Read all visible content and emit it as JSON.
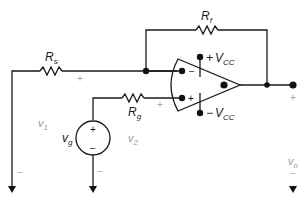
{
  "diagram": {
    "type": "op-amp circuit",
    "components": {
      "Rs": {
        "label": "R",
        "sub": "s"
      },
      "Rf": {
        "label": "R",
        "sub": "f"
      },
      "Rg": {
        "label": "R",
        "sub": "g"
      },
      "vg": {
        "label": "v",
        "sub": "g",
        "plus": "+",
        "minus": "−"
      },
      "opamp": {
        "inv": "−",
        "noninv": "+",
        "vcc_pos": {
          "sign": "+",
          "label": "V",
          "sub": "CC"
        },
        "vcc_neg": {
          "sign": "−",
          "label": "V",
          "sub": "CC"
        }
      }
    },
    "voltages": {
      "v1": {
        "label": "v",
        "sub": "1",
        "plus": "+",
        "minus": "−"
      },
      "v2": {
        "label": "v",
        "sub": "2",
        "plus": "+",
        "minus": "−"
      },
      "vo": {
        "label": "v",
        "sub": "o",
        "plus": "+",
        "minus": "−"
      }
    }
  }
}
